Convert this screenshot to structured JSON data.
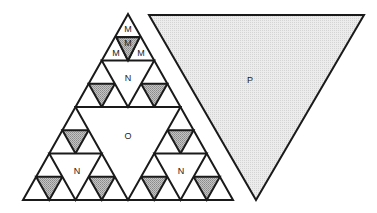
{
  "diagram": {
    "type": "sierpinski-triangle-comparison",
    "colors": {
      "stroke": "#1a1a1a",
      "shaded_fill": "#a8a8a8",
      "large_fill": "#e2e2e2",
      "background": "#ffffff"
    },
    "labels": {
      "m_top": "M",
      "m_center": "M",
      "m_left": "M",
      "m_right": "M",
      "n_top": "N",
      "n_left": "N",
      "n_right": "N",
      "o_center": "O",
      "p_large": "P"
    }
  }
}
